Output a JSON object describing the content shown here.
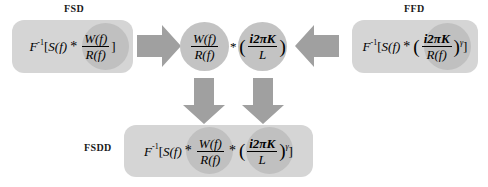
{
  "diagram": {
    "colors": {
      "box_fill": "#d5d5d5",
      "circle_fill": "#c3c3c3",
      "inner_circle_fill": "#c0c0c0",
      "arrow_fill": "#a0a0a0",
      "text": "#000000",
      "background": "#ffffff"
    }
  },
  "labels": {
    "fsd": "FSD",
    "ffd": "FFD",
    "fsdd": "FSDD"
  },
  "formulas": {
    "fsd": {
      "prefix": "F",
      "prefix_exp": "-1",
      "bracket_open": "[",
      "s_of_f": "S(f)",
      "conv": "*",
      "numerator": "W(f)",
      "denominator": "R(f)",
      "bracket_close": "]",
      "plain": "F^-1[S(f)* W(f)/R(f)]"
    },
    "ffd": {
      "prefix": "F",
      "prefix_exp": "-1",
      "bracket_open": "[",
      "s_of_f": "S(f)",
      "conv": "*",
      "paren_open": "(",
      "numerator": "i2πK",
      "denominator": "R(f)",
      "paren_close": ")",
      "exponent": "γ",
      "bracket_close": "]",
      "plain": "F^-1[S(f)* (i2πK/R(f))^γ]"
    },
    "fsdd": {
      "prefix": "F",
      "prefix_exp": "-1",
      "bracket_open": "[",
      "s_of_f": "S(f)",
      "conv1": "*",
      "numerator1": "W(f)",
      "denominator1": "R(f)",
      "conv2": "*",
      "paren_open": "(",
      "numerator2": "i2πK",
      "denominator2": "L",
      "paren_close": ")",
      "exponent": "γ",
      "bracket_close": "]",
      "plain": "F^-1[S(f)* W(f)/R(f) * (i2πK/L)^γ]"
    }
  },
  "circles": {
    "wr": {
      "numerator": "W(f)",
      "denominator": "R(f)",
      "plain": "W(f)/R(f)"
    },
    "ikl": {
      "paren_open": "(",
      "numerator": "i2πK",
      "denominator": "L",
      "paren_close": ")",
      "plain": "(i2πK/L)"
    },
    "separator": "*"
  },
  "arrows": [
    {
      "name": "arrow-fsd-to-center",
      "direction": "right"
    },
    {
      "name": "arrow-ffd-to-center",
      "direction": "left"
    },
    {
      "name": "arrow-wr-down",
      "direction": "down"
    },
    {
      "name": "arrow-ikl-down",
      "direction": "down"
    }
  ]
}
